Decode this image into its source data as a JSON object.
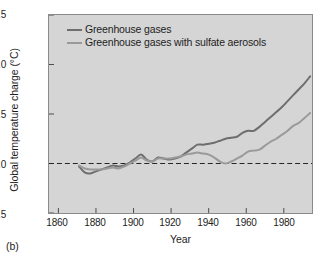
{
  "figure": {
    "panel_label": "(b)",
    "background_color": "#d5d5d5",
    "frame_color": "#8a8a8a"
  },
  "legend": {
    "position": "top-left-inside",
    "entries": [
      {
        "label": "Greenhouse gases",
        "color": "#6e6e6e"
      },
      {
        "label": "Greenhouse gases with sulfate aerosols",
        "color": "#9a9a9a"
      }
    ]
  },
  "axes": {
    "ylabel": "Global temperature charge (°C)",
    "xlabel": "Year",
    "yticks": [
      "1.5",
      "1.0",
      "0.5",
      "0.0",
      "-0.5"
    ],
    "xticks": [
      "1860",
      "1880",
      "1900",
      "1920",
      "1940",
      "1960",
      "1980"
    ]
  },
  "chart_data": {
    "type": "line",
    "title": "",
    "xlabel": "Year",
    "ylabel": "Global temperature charge (°C)",
    "xlim": [
      1855,
      1995
    ],
    "ylim": [
      -0.5,
      1.5
    ],
    "ytick_values": [
      1.5,
      1.0,
      0.5,
      0.0,
      -0.5
    ],
    "xtick_values": [
      1860,
      1880,
      1900,
      1920,
      1940,
      1960,
      1980
    ],
    "grid": false,
    "legend_position": "upper left",
    "reference_lines": [
      {
        "axis": "y",
        "value": 0.0,
        "style": "dashed",
        "color": "#222222"
      }
    ],
    "series": [
      {
        "name": "Greenhouse gases",
        "color": "#6e6e6e",
        "x": [
          1871,
          1874,
          1877,
          1880,
          1883,
          1886,
          1889,
          1892,
          1895,
          1898,
          1901,
          1904,
          1907,
          1910,
          1913,
          1916,
          1919,
          1922,
          1925,
          1928,
          1931,
          1934,
          1937,
          1940,
          1943,
          1946,
          1949,
          1952,
          1955,
          1958,
          1961,
          1964,
          1967,
          1970,
          1973,
          1976,
          1979,
          1982,
          1985,
          1988,
          1991,
          1994
        ],
        "y": [
          -0.03,
          -0.09,
          -0.1,
          -0.08,
          -0.06,
          -0.04,
          -0.02,
          -0.03,
          -0.02,
          0.01,
          0.05,
          0.09,
          0.04,
          0.02,
          0.06,
          0.05,
          0.04,
          0.05,
          0.07,
          0.11,
          0.15,
          0.19,
          0.19,
          0.2,
          0.21,
          0.23,
          0.25,
          0.26,
          0.27,
          0.31,
          0.33,
          0.33,
          0.37,
          0.42,
          0.47,
          0.52,
          0.57,
          0.63,
          0.69,
          0.75,
          0.81,
          0.88
        ]
      },
      {
        "name": "Greenhouse gases with sulfate aerosols",
        "color": "#9a9a9a",
        "x": [
          1871,
          1874,
          1877,
          1880,
          1883,
          1886,
          1889,
          1892,
          1895,
          1898,
          1901,
          1904,
          1907,
          1910,
          1913,
          1916,
          1919,
          1922,
          1925,
          1928,
          1931,
          1934,
          1937,
          1940,
          1943,
          1946,
          1949,
          1952,
          1955,
          1958,
          1961,
          1964,
          1967,
          1970,
          1973,
          1976,
          1979,
          1982,
          1985,
          1988,
          1991,
          1994
        ],
        "y": [
          -0.02,
          -0.05,
          -0.06,
          -0.06,
          -0.06,
          -0.05,
          -0.04,
          -0.05,
          -0.03,
          0.0,
          0.03,
          0.06,
          0.03,
          0.02,
          0.05,
          0.05,
          0.05,
          0.06,
          0.07,
          0.09,
          0.1,
          0.11,
          0.1,
          0.09,
          0.06,
          0.02,
          0.0,
          0.02,
          0.05,
          0.08,
          0.12,
          0.13,
          0.14,
          0.18,
          0.22,
          0.25,
          0.29,
          0.33,
          0.38,
          0.41,
          0.46,
          0.51
        ]
      }
    ]
  }
}
